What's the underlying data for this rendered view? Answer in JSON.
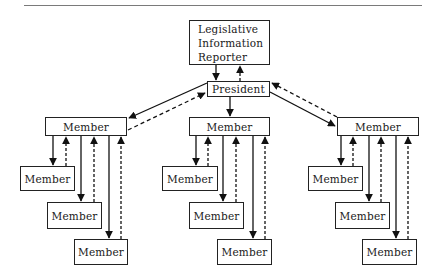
{
  "diagram": {
    "type": "organizational-communication-flow",
    "nodes": {
      "reporter": {
        "lines": [
          "Legislative",
          "Information",
          "Reporter"
        ],
        "x": 189,
        "y": 20,
        "w": 81,
        "h": 45
      },
      "president": {
        "label": "President",
        "x": 207,
        "y": 81,
        "w": 63,
        "h": 16
      },
      "left_member": {
        "label": "Member",
        "x": 45,
        "y": 117,
        "w": 82,
        "h": 19
      },
      "center_member": {
        "label": "Member",
        "x": 189,
        "y": 117,
        "w": 81,
        "h": 19
      },
      "right_member": {
        "label": "Member",
        "x": 337,
        "y": 117,
        "w": 82,
        "h": 19
      },
      "left_child_1": {
        "label": "Member",
        "x": 20,
        "y": 166,
        "w": 55,
        "h": 25
      },
      "left_child_2": {
        "label": "Member",
        "x": 47,
        "y": 202,
        "w": 55,
        "h": 27
      },
      "left_child_3": {
        "label": "Member",
        "x": 74,
        "y": 239,
        "w": 54,
        "h": 26
      },
      "center_child_1": {
        "label": "Member",
        "x": 162,
        "y": 166,
        "w": 56,
        "h": 25
      },
      "center_child_2": {
        "label": "Member",
        "x": 189,
        "y": 202,
        "w": 55,
        "h": 27
      },
      "center_child_3": {
        "label": "Member",
        "x": 217,
        "y": 239,
        "w": 55,
        "h": 26
      },
      "right_child_1": {
        "label": "Member",
        "x": 308,
        "y": 166,
        "w": 55,
        "h": 25
      },
      "right_child_2": {
        "label": "Member",
        "x": 335,
        "y": 202,
        "w": 55,
        "h": 27
      },
      "right_child_3": {
        "label": "Member",
        "x": 362,
        "y": 239,
        "w": 55,
        "h": 26
      }
    },
    "edges_legend": {
      "solid": "downward flow (information sent)",
      "dashed": "upward flow (feedback)"
    },
    "edges": [
      {
        "from": "reporter",
        "to": "president",
        "style": "solid"
      },
      {
        "from": "president",
        "to": "reporter",
        "style": "dashed"
      },
      {
        "from": "president",
        "to": "left_member",
        "style": "solid"
      },
      {
        "from": "left_member",
        "to": "president",
        "style": "dashed"
      },
      {
        "from": "president",
        "to": "center_member",
        "style": "solid"
      },
      {
        "from": "president",
        "to": "right_member",
        "style": "solid"
      },
      {
        "from": "right_member",
        "to": "president",
        "style": "dashed"
      },
      {
        "from": "left_member",
        "to": "left_child_1",
        "style": "solid"
      },
      {
        "from": "left_child_1",
        "to": "left_member",
        "style": "dashed"
      },
      {
        "from": "left_member",
        "to": "left_child_2",
        "style": "solid"
      },
      {
        "from": "left_child_2",
        "to": "left_member",
        "style": "dashed"
      },
      {
        "from": "left_member",
        "to": "left_child_3",
        "style": "solid"
      },
      {
        "from": "left_child_3",
        "to": "left_member",
        "style": "dashed"
      },
      {
        "from": "center_member",
        "to": "center_child_1",
        "style": "solid"
      },
      {
        "from": "center_child_1",
        "to": "center_member",
        "style": "dashed"
      },
      {
        "from": "center_member",
        "to": "center_child_2",
        "style": "solid"
      },
      {
        "from": "center_child_2",
        "to": "center_member",
        "style": "dashed"
      },
      {
        "from": "center_member",
        "to": "center_child_3",
        "style": "solid"
      },
      {
        "from": "center_child_3",
        "to": "center_member",
        "style": "dashed"
      },
      {
        "from": "right_member",
        "to": "right_child_1",
        "style": "solid"
      },
      {
        "from": "right_child_1",
        "to": "right_member",
        "style": "dashed"
      },
      {
        "from": "right_member",
        "to": "right_child_2",
        "style": "solid"
      },
      {
        "from": "right_child_2",
        "to": "right_member",
        "style": "dashed"
      },
      {
        "from": "right_member",
        "to": "right_child_3",
        "style": "solid"
      },
      {
        "from": "right_child_3",
        "to": "right_member",
        "style": "dashed"
      }
    ]
  }
}
